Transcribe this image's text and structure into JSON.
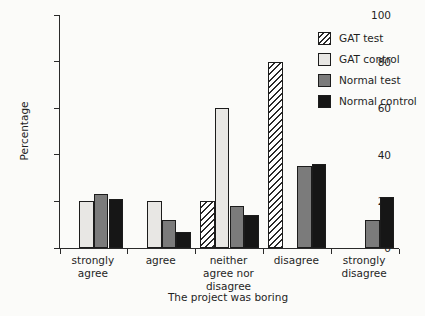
{
  "figure": {
    "background": "#fbfbf9",
    "axis_color": "#2a2a2a"
  },
  "chart_data": {
    "type": "bar",
    "title": "",
    "xlabel": "The project was boring",
    "ylabel": "Percentage",
    "ylim": [
      0,
      100
    ],
    "yticks": [
      0,
      20,
      40,
      60,
      80,
      100
    ],
    "grid": false,
    "legend_position": "top-right",
    "categories": [
      "strongly\nagree",
      "agree",
      "neither\nagree nor\ndisagree",
      "disagree",
      "strongly\ndisagree"
    ],
    "series": [
      {
        "name": "GAT test",
        "style": "hatch",
        "color": "#ffffff",
        "values": [
          0,
          0,
          20,
          80,
          0
        ]
      },
      {
        "name": "GAT control",
        "style": "solid",
        "color": "#e8e7e4",
        "values": [
          20,
          20,
          60,
          0,
          0
        ]
      },
      {
        "name": "Normal test",
        "style": "solid",
        "color": "#7b7b7b",
        "values": [
          23,
          12,
          18,
          35,
          12
        ]
      },
      {
        "name": "Normal control",
        "style": "solid",
        "color": "#161616",
        "values": [
          21,
          7,
          14,
          36,
          22
        ]
      }
    ]
  }
}
